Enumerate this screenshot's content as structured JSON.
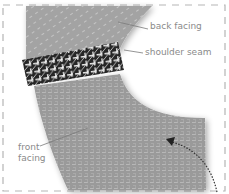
{
  "diagram": {
    "labels": {
      "back_facing": "back facing",
      "shoulder_seam": "shoulder seam",
      "front_facing_line1": "front",
      "front_facing_line2": "facing"
    },
    "colors": {
      "fabric": "#9a9a9a",
      "fabric_thread": "#c4c4c4",
      "seam": "#2a2a2a",
      "seam_stitch": "#e8e8e8",
      "label_text": "#8a8a8a",
      "leader_line": "#7a7a7a",
      "dashed_border": "#b5b5b5",
      "arrow": "#333333"
    },
    "elements": [
      "back-facing-panel",
      "shoulder-seam",
      "front-facing-panel",
      "dashed-frame",
      "curved-arrow"
    ]
  }
}
